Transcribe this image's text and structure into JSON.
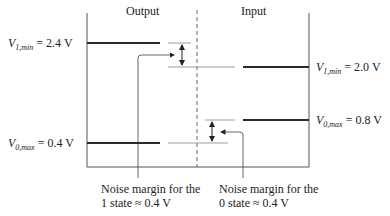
{
  "titles": {
    "output": "Output",
    "input": "Input"
  },
  "output_levels": {
    "v1": {
      "symbol": "V",
      "subscript": "1,min",
      "value": "= 2.4 V"
    },
    "v0": {
      "symbol": "V",
      "subscript": "0,max",
      "value": "= 0.4 V"
    }
  },
  "input_levels": {
    "v1": {
      "symbol": "V",
      "subscript": "1,min",
      "value": "= 2.0 V"
    },
    "v0": {
      "symbol": "V",
      "subscript": "0,max",
      "value": "= 0.8 V"
    }
  },
  "notes": {
    "state1": {
      "line1": "Noise margin for the",
      "line2": "1 state ≈ 0.4 V"
    },
    "state0": {
      "line1": "Noise margin for the",
      "line2": "0 state ≈ 0.4 V"
    }
  },
  "colors": {
    "thick_line": "#2a2a2a",
    "thin_line": "#777777",
    "axis": "#555555"
  }
}
